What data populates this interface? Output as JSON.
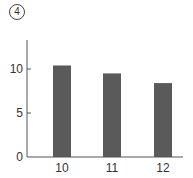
{
  "panel": {
    "label": "4"
  },
  "chart_data": {
    "type": "bar",
    "title": "",
    "panel_label": "④",
    "categories": [
      "10",
      "11",
      "12"
    ],
    "values": [
      10.4,
      9.5,
      8.4
    ],
    "xlabel": "",
    "ylabel": "",
    "ylim": [
      0,
      13
    ],
    "yticks": [
      0,
      5,
      10
    ],
    "grid": false,
    "legend": null,
    "bar_color": "#5a5a5a"
  }
}
